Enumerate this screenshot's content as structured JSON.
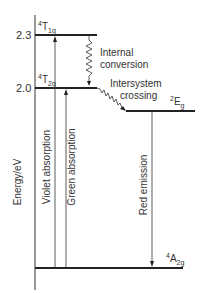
{
  "diagram": {
    "type": "energy-level-diagram",
    "y_axis": {
      "label": "Energy/eV",
      "ticks": [
        {
          "value": "2.3",
          "y": 35
        },
        {
          "value": "2.0",
          "y": 88
        }
      ]
    },
    "levels": [
      {
        "id": "T1g",
        "sup": "4",
        "main": "T",
        "sub": "1g",
        "energy": 2.3
      },
      {
        "id": "T2g",
        "sup": "4",
        "main": "T",
        "sub": "2g",
        "energy": 2.0
      },
      {
        "id": "Eg",
        "sup": "2",
        "main": "E",
        "sub": "g"
      },
      {
        "id": "A2g",
        "sup": "4",
        "main": "A",
        "sub": "2g"
      }
    ],
    "transitions": [
      {
        "label": "Violet absorption",
        "from": "A2g",
        "to": "T1g",
        "style": "arrow-up"
      },
      {
        "label": "Green absorption",
        "from": "A2g",
        "to": "T2g",
        "style": "arrow-up"
      },
      {
        "label_line1": "Internal",
        "label_line2": "conversion",
        "from": "T1g",
        "to": "T2g",
        "style": "zigzag"
      },
      {
        "label_line1": "Intersystem",
        "label_line2": "crossing",
        "from": "T2g",
        "to": "Eg",
        "style": "zigzag"
      },
      {
        "label": "Red emission",
        "from": "Eg",
        "to": "A2g",
        "style": "arrow-down"
      }
    ]
  }
}
